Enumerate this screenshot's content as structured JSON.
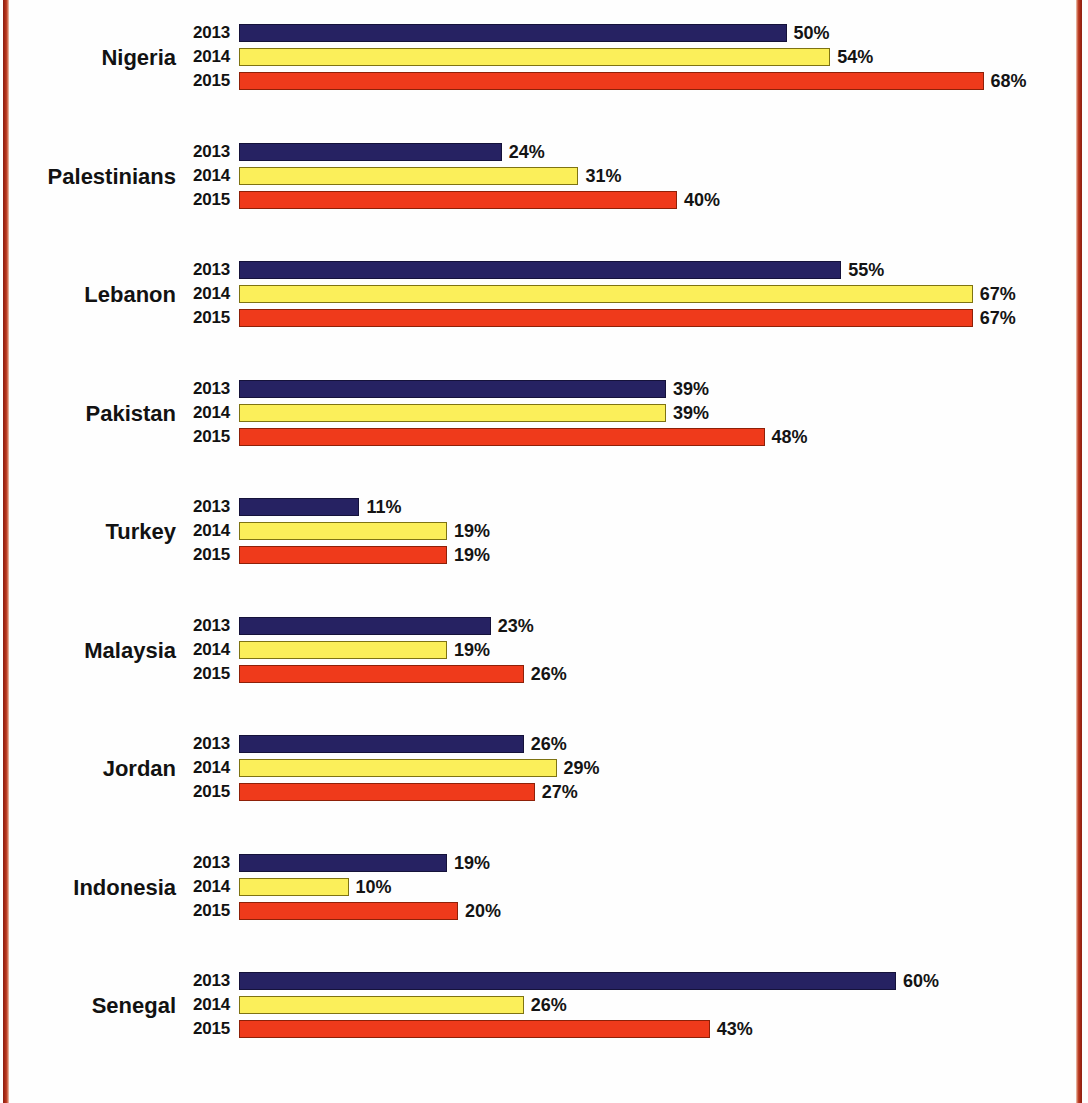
{
  "frame": {
    "border_color": "#a82a15",
    "background": "#ffffff"
  },
  "legend_years": [
    "2013",
    "2014",
    "2015"
  ],
  "series_colors": {
    "2013": "#262262",
    "2014": "#fbef5a",
    "2015": "#ef3a1b"
  },
  "chart_data": {
    "type": "bar",
    "orientation": "horizontal",
    "title": "",
    "subtitle": "",
    "xlabel": "",
    "ylabel": "",
    "xlim": [
      0,
      75
    ],
    "grid": false,
    "legend_position": "inline-row-labels",
    "value_suffix": "%",
    "categories": [
      "Nigeria",
      "Palestinians",
      "Lebanon",
      "Pakistan",
      "Turkey",
      "Malaysia",
      "Jordan",
      "Indonesia",
      "Senegal"
    ],
    "series": [
      {
        "name": "2013",
        "color": "#262262",
        "values": [
          50,
          24,
          55,
          39,
          11,
          23,
          26,
          19,
          60
        ]
      },
      {
        "name": "2014",
        "color": "#fbef5a",
        "values": [
          54,
          31,
          67,
          39,
          19,
          19,
          29,
          10,
          26
        ]
      },
      {
        "name": "2015",
        "color": "#ef3a1b",
        "values": [
          68,
          40,
          67,
          48,
          19,
          26,
          27,
          20,
          43
        ]
      }
    ]
  },
  "groups": [
    {
      "label": "Nigeria",
      "rows": [
        {
          "year": "2013",
          "value": 50,
          "value_label": "50%"
        },
        {
          "year": "2014",
          "value": 54,
          "value_label": "54%"
        },
        {
          "year": "2015",
          "value": 68,
          "value_label": "68%"
        }
      ]
    },
    {
      "label": "Palestinians",
      "rows": [
        {
          "year": "2013",
          "value": 24,
          "value_label": "24%"
        },
        {
          "year": "2014",
          "value": 31,
          "value_label": "31%"
        },
        {
          "year": "2015",
          "value": 40,
          "value_label": "40%"
        }
      ]
    },
    {
      "label": "Lebanon",
      "rows": [
        {
          "year": "2013",
          "value": 55,
          "value_label": "55%"
        },
        {
          "year": "2014",
          "value": 67,
          "value_label": "67%"
        },
        {
          "year": "2015",
          "value": 67,
          "value_label": "67%"
        }
      ]
    },
    {
      "label": "Pakistan",
      "rows": [
        {
          "year": "2013",
          "value": 39,
          "value_label": "39%"
        },
        {
          "year": "2014",
          "value": 39,
          "value_label": "39%"
        },
        {
          "year": "2015",
          "value": 48,
          "value_label": "48%"
        }
      ]
    },
    {
      "label": "Turkey",
      "rows": [
        {
          "year": "2013",
          "value": 11,
          "value_label": "11%"
        },
        {
          "year": "2014",
          "value": 19,
          "value_label": "19%"
        },
        {
          "year": "2015",
          "value": 19,
          "value_label": "19%"
        }
      ]
    },
    {
      "label": "Malaysia",
      "rows": [
        {
          "year": "2013",
          "value": 23,
          "value_label": "23%"
        },
        {
          "year": "2014",
          "value": 19,
          "value_label": "19%"
        },
        {
          "year": "2015",
          "value": 26,
          "value_label": "26%"
        }
      ]
    },
    {
      "label": "Jordan",
      "rows": [
        {
          "year": "2013",
          "value": 26,
          "value_label": "26%"
        },
        {
          "year": "2014",
          "value": 29,
          "value_label": "29%"
        },
        {
          "year": "2015",
          "value": 27,
          "value_label": "27%"
        }
      ]
    },
    {
      "label": "Indonesia",
      "rows": [
        {
          "year": "2013",
          "value": 19,
          "value_label": "19%"
        },
        {
          "year": "2014",
          "value": 10,
          "value_label": "10%"
        },
        {
          "year": "2015",
          "value": 20,
          "value_label": "20%"
        }
      ]
    },
    {
      "label": "Senegal",
      "rows": [
        {
          "year": "2013",
          "value": 60,
          "value_label": "60%"
        },
        {
          "year": "2014",
          "value": 26,
          "value_label": "26%"
        },
        {
          "year": "2015",
          "value": 43,
          "value_label": "43%"
        }
      ]
    }
  ],
  "layout": {
    "px_per_percent": 10.95,
    "group_top_start": 21,
    "group_pitch": 118.5
  }
}
